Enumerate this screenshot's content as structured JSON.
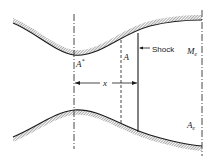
{
  "diagram": {
    "type": "converging-diverging nozzle with normal shock",
    "labels": {
      "throat_area": "A*",
      "throat_area_base": "A",
      "throat_area_sup": "*",
      "local_area": "A",
      "shock": "Shock",
      "exit_mach": "M",
      "exit_mach_sub": "e",
      "exit_area": "A",
      "exit_area_sub": "e",
      "distance": "x"
    },
    "colors": {
      "line": "#1a1a1a",
      "hatch": "#8a8a8a",
      "background": "#ffffff"
    }
  }
}
